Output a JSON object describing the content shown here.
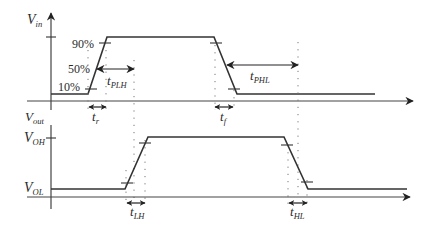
{
  "diagram": {
    "colors": {
      "line": "#333333",
      "axis": "#444444",
      "guide": "#777777",
      "background": "#ffffff"
    },
    "input": {
      "axis_label": "V",
      "axis_label_sub": "in",
      "levels": {
        "p90": "90%",
        "p50": "50%",
        "p10": "10%"
      },
      "rise_time_label": "t",
      "rise_time_sub": "r",
      "fall_time_label": "t",
      "fall_time_sub": "f"
    },
    "output": {
      "axis_label": "V",
      "axis_label_sub": "out",
      "high_label": "V",
      "high_label_sub": "OH",
      "low_label": "V",
      "low_label_sub": "OL",
      "rise_time_label": "t",
      "rise_time_sub": "LH",
      "fall_time_label": "t",
      "fall_time_sub": "HL"
    },
    "delays": {
      "plh_label": "t",
      "plh_sub": "PLH",
      "phl_label": "t",
      "phl_sub": "PHL"
    }
  }
}
